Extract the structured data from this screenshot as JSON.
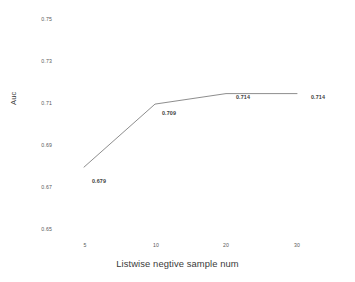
{
  "chart_data": {
    "type": "line",
    "title": "",
    "xlabel": "Listwise negtive sample num",
    "ylabel": "Auc",
    "categories": [
      "5",
      "10",
      "20",
      "30"
    ],
    "values": [
      0.679,
      0.709,
      0.714,
      0.714
    ],
    "point_labels": [
      "0.679",
      "0.709",
      "0.714",
      "0.714"
    ],
    "ylim": [
      0.65,
      0.75
    ],
    "yticks": [
      "0.75",
      "0.73",
      "0.71",
      "0.69",
      "0.67",
      "0.65"
    ],
    "ytick_values": [
      0.75,
      0.73,
      0.71,
      0.69,
      0.67,
      0.65
    ],
    "xticks": [
      "5",
      "10",
      "20",
      "30"
    ],
    "grid": false,
    "legend": false,
    "series": [
      {
        "name": "Auc",
        "values": [
          0.679,
          0.709,
          0.714,
          0.714
        ],
        "color": "#808080"
      }
    ],
    "line_color": "#808080",
    "label_color": "#404040",
    "tick_color": "#595959"
  },
  "yticks": {
    "t0": "0.75",
    "t1": "0.73",
    "t2": "0.71",
    "t3": "0.69",
    "t4": "0.67",
    "t5": "0.65"
  },
  "xticks": {
    "t0": "5",
    "t1": "10",
    "t2": "20",
    "t3": "30"
  },
  "labels": {
    "p0": "0.679",
    "p1": "0.709",
    "p2": "0.714",
    "p3": "0.714"
  },
  "axes": {
    "x_title": "Listwise negtive sample num",
    "y_title": "Auc"
  }
}
